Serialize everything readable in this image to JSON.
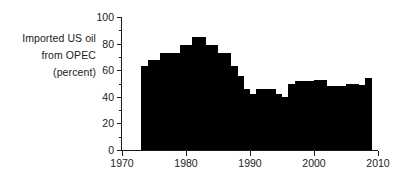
{
  "caption": {
    "line1": "Imported US oil",
    "line2": "from OPEC",
    "line3": "(percent)"
  },
  "chart_data": {
    "type": "bar",
    "title": "",
    "subtitle": "",
    "xlabel": "",
    "ylabel": "Imported US oil from OPEC (percent)",
    "xlim": [
      1970,
      2010
    ],
    "ylim": [
      0,
      100
    ],
    "grid": false,
    "legend": null,
    "bar_color": "#000000",
    "axis_color": "#1a1a1a",
    "background_color": "#ffffff",
    "x_ticks": [
      1970,
      1980,
      1990,
      2000,
      2010
    ],
    "x_tick_labels": [
      "1970",
      "1980",
      "1990",
      "2000",
      "2010"
    ],
    "y_ticks_major": [
      0,
      20,
      40,
      60,
      80,
      100
    ],
    "y_tick_labels": [
      "0",
      "20",
      "40",
      "60",
      "80",
      "100"
    ],
    "y_ticks_minor": [
      10,
      30,
      50,
      70,
      90
    ],
    "categories": [
      1973,
      1974,
      1975,
      1976,
      1977,
      1978,
      1979,
      1980,
      1981,
      1982,
      1983,
      1984,
      1985,
      1986,
      1987,
      1988,
      1989,
      1990,
      1991,
      1992,
      1993,
      1994,
      1995,
      1996,
      1997,
      1998,
      1999,
      2000,
      2001,
      2002,
      2003,
      2004,
      2005,
      2006,
      2007,
      2008
    ],
    "values": [
      63,
      68,
      68,
      73,
      73,
      73,
      79,
      79,
      85,
      85,
      79,
      79,
      73,
      73,
      63,
      56,
      46,
      42,
      46,
      46,
      46,
      42,
      40,
      50,
      52,
      52,
      52,
      53,
      53,
      48,
      48,
      48,
      50,
      50,
      49,
      54
    ]
  }
}
